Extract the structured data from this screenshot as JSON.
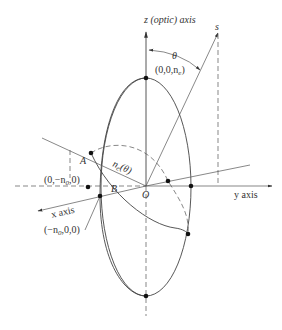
{
  "diagram": {
    "labels": {
      "z_axis": "z (optic) axis",
      "s_vector": "s",
      "theta": "θ",
      "top_point": "(0,0,n",
      "top_point_sub": "e",
      "top_point_end": ")",
      "point_a": "A",
      "ne_theta": "n",
      "ne_theta_sub": "e",
      "ne_theta_arg": "(θ)",
      "y_neg_point": "(0,−n",
      "y_neg_point_sub": "0",
      "y_neg_point_end": ",0)",
      "point_b": "B",
      "origin": "O",
      "x_axis": "x axis",
      "y_axis": "y axis",
      "x_neg_point": "(−n",
      "x_neg_point_sub": "0",
      "x_neg_point_end": ",0,0)"
    },
    "colors": {
      "line": "#444444",
      "text": "#333333",
      "background": "#ffffff"
    }
  }
}
